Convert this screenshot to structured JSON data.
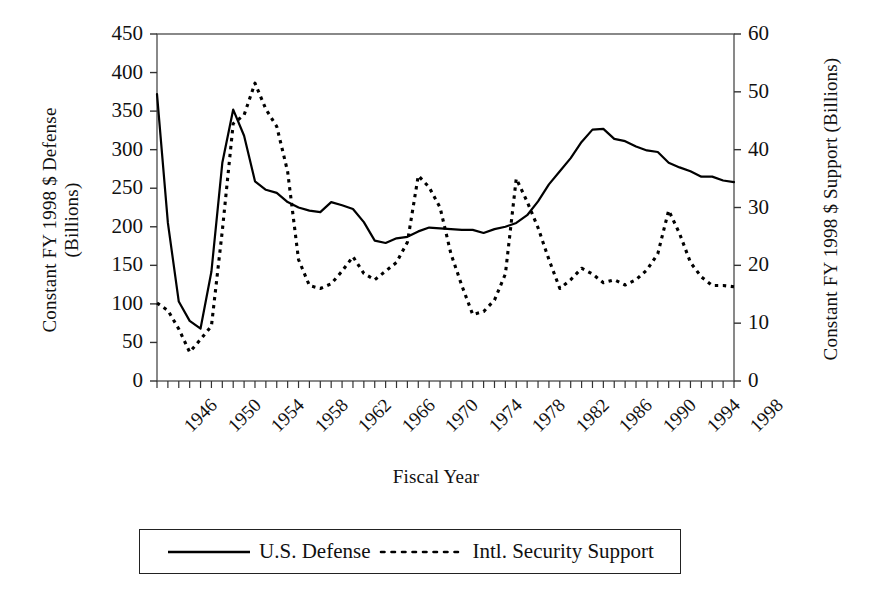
{
  "chart_data": {
    "type": "line",
    "title": "",
    "xlabel": "Fiscal Year",
    "ylabel": "Constant FY 1998 $ Defense (Billions)",
    "ylabel_left_line1": "Constant FY 1998 $ Defense",
    "ylabel_left_line2": "(Billions)",
    "ylabel_right_line1": "Constant FY 1998 $ Support",
    "ylabel_right_line2": "(Billions)",
    "grid": false,
    "legend_position": "bottom",
    "xlim": [
      1946,
      1999
    ],
    "ylim_left": [
      0,
      450
    ],
    "ylim_right": [
      0,
      60
    ],
    "yticks_left": [
      0,
      50,
      100,
      150,
      200,
      250,
      300,
      350,
      400,
      450
    ],
    "yticks_right": [
      0,
      10,
      20,
      30,
      40,
      50,
      60
    ],
    "xtick_labels": [
      "1946",
      "1950",
      "1954",
      "1958",
      "1962",
      "1966",
      "1970",
      "1974",
      "1978",
      "1982",
      "1986",
      "1990",
      "1994",
      "1998"
    ],
    "xtick_years": [
      1946,
      1950,
      1954,
      1958,
      1962,
      1966,
      1970,
      1974,
      1978,
      1982,
      1986,
      1990,
      1994,
      1998
    ],
    "x": [
      1946,
      1947,
      1948,
      1949,
      1950,
      1951,
      1952,
      1953,
      1954,
      1955,
      1956,
      1957,
      1958,
      1959,
      1960,
      1961,
      1962,
      1963,
      1964,
      1965,
      1966,
      1967,
      1968,
      1969,
      1970,
      1971,
      1972,
      1973,
      1974,
      1975,
      1976,
      1977,
      1978,
      1979,
      1980,
      1981,
      1982,
      1983,
      1984,
      1985,
      1986,
      1987,
      1988,
      1989,
      1990,
      1991,
      1992,
      1993,
      1994,
      1995,
      1996,
      1997,
      1998,
      1999
    ],
    "series": [
      {
        "name": "U.S. Defense",
        "axis": "left",
        "style": "solid",
        "color": "#000000",
        "units": "Billions of constant FY 1998 dollars",
        "values": [
          372,
          205,
          103,
          78,
          68,
          142,
          283,
          352,
          318,
          259,
          248,
          244,
          232,
          225,
          221,
          219,
          232,
          228,
          223,
          206,
          182,
          179,
          185,
          187,
          194,
          199,
          198,
          197,
          196,
          196,
          192,
          197,
          200,
          205,
          215,
          233,
          255,
          272,
          289,
          310,
          326,
          327,
          314,
          311,
          304,
          299,
          297,
          283,
          277,
          272,
          265,
          265,
          260,
          258
        ]
      },
      {
        "name": "Intl. Security Support",
        "axis": "right",
        "style": "dotted",
        "color": "#000000",
        "units": "Billions of constant FY 1998 dollars",
        "values": [
          13.5,
          12.2,
          9.0,
          5.0,
          7.2,
          9.5,
          26.0,
          44.5,
          46.0,
          51.5,
          47.0,
          44.0,
          36.2,
          21.0,
          16.5,
          16.0,
          16.8,
          19.0,
          21.5,
          18.6,
          17.5,
          19.0,
          20.5,
          24.0,
          35.5,
          33.5,
          30.0,
          22.0,
          16.5,
          11.5,
          12.0,
          14.0,
          18.5,
          35.0,
          31.0,
          26.5,
          21.0,
          16.0,
          17.5,
          19.5,
          18.5,
          17.0,
          17.5,
          16.6,
          17.5,
          19.2,
          22.0,
          29.5,
          25.5,
          20.5,
          18.0,
          16.5,
          16.5,
          16.3
        ]
      }
    ],
    "annotations": []
  },
  "legend": {
    "entries": [
      {
        "label": "U.S. Defense",
        "style": "solid"
      },
      {
        "label": "Intl. Security Support",
        "style": "dotted"
      }
    ]
  },
  "axes": {
    "left_title_line1": "Constant FY 1998 $ Defense",
    "left_title_line2": "(Billions)",
    "right_title_line1": "Constant FY 1998 $ Support",
    "right_title_line2": "(Billions)",
    "x_title": "Fiscal Year"
  }
}
